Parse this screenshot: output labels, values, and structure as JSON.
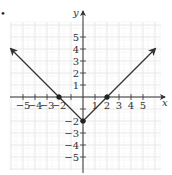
{
  "figure": {
    "bullet": "•"
  },
  "chart_data": {
    "type": "line",
    "title": "",
    "function_shape": "absolute value V",
    "xlabel": "x",
    "ylabel": "y",
    "xlim": [
      -5.8,
      6.3
    ],
    "ylim": [
      -5.9,
      6.2
    ],
    "grid": true,
    "x_ticks": [
      -5,
      -4,
      -3,
      -2,
      -1,
      1,
      2,
      3,
      4,
      5
    ],
    "x_tick_labels": [
      "−5",
      "−4",
      "−3",
      "−2",
      "",
      "1",
      "2",
      "3",
      "4",
      "5"
    ],
    "y_ticks": [
      -5,
      -4,
      -3,
      -2,
      -1,
      1,
      2,
      3,
      4,
      5
    ],
    "y_tick_labels": [
      "−5",
      "−4",
      "−3",
      "−2",
      "",
      "1",
      "2",
      "3",
      "4",
      "5"
    ],
    "series": [
      {
        "name": "graph",
        "x": [
          -6,
          -2,
          0,
          2,
          6
        ],
        "y": [
          4,
          0,
          -2,
          0,
          4
        ],
        "arrows_at_ends": true
      }
    ],
    "points": [
      {
        "x": -2,
        "y": 0
      },
      {
        "x": 0,
        "y": -2
      },
      {
        "x": 2,
        "y": 0
      }
    ]
  }
}
